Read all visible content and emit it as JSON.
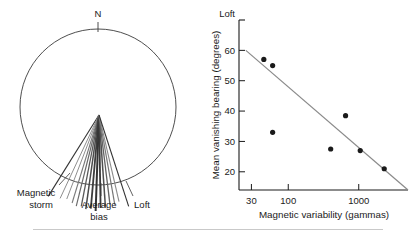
{
  "figure": {
    "panels": [
      {
        "id": "circular-diagram",
        "north_label": "N",
        "labels": {
          "magnetic_storm_line1": "Magnetic",
          "magnetic_storm_line2": "storm",
          "average_bias_line1": "Average",
          "average_bias_line2": "bias",
          "loft": "Loft"
        }
      },
      {
        "id": "scatter-plot"
      }
    ]
  },
  "chart_data": [
    {
      "type": "scatter",
      "id": "vanishing-bearing-vs-magnetic-variability",
      "title": "",
      "xlabel": "Magnetic variability (gammas)",
      "ylabel": "Mean vanishing bearing (degrees)",
      "xscale": "log",
      "yscale": "linear",
      "xlim": [
        20,
        5000
      ],
      "ylim": [
        14,
        70
      ],
      "xticks": [
        30,
        100,
        1000
      ],
      "xtick_labels": [
        "30",
        "100",
        "1000"
      ],
      "yticks": [
        20,
        30,
        40,
        50,
        60
      ],
      "ytick_labels": [
        "20",
        "30",
        "40",
        "50",
        "60"
      ],
      "y_top_label": "Loft",
      "y_top_value": 70,
      "grid": false,
      "legend": null,
      "x": [
        45,
        60,
        60,
        400,
        650,
        1050,
        2300
      ],
      "y": [
        57,
        55,
        33,
        27.5,
        38.5,
        27,
        21,
        0
      ],
      "points": [
        {
          "x": 45,
          "y": 57
        },
        {
          "x": 60,
          "y": 55
        },
        {
          "x": 60,
          "y": 33
        },
        {
          "x": 400,
          "y": 27.5
        },
        {
          "x": 650,
          "y": 38.5
        },
        {
          "x": 1050,
          "y": 27
        },
        {
          "x": 2300,
          "y": 21
        }
      ],
      "trendline": {
        "type": "line",
        "x": [
          25,
          5000
        ],
        "y": [
          60,
          14
        ],
        "color": "#8a8a8a"
      },
      "marker_color": "#1a1a1a",
      "axis_color": "#1a1a1a"
    },
    {
      "type": "polar-vector",
      "id": "vanishing-bearings-circle",
      "title": "",
      "north_label": "N",
      "note": "Circular diagram of individual vanishing bearing vectors radiating from a release point; bearings given in compass degrees clockwise from North.",
      "circle": {
        "cx": 98,
        "cy": 107,
        "r": 78
      },
      "origin": {
        "x": 99,
        "y": 115
      },
      "bearings_deg": [
        212,
        214,
        189,
        191,
        193,
        176,
        178,
        180,
        182,
        184,
        186,
        170,
        168,
        165,
        162,
        160
      ],
      "annotated_bearings": {
        "magnetic_storm": 212,
        "average_bias": 180,
        "loft": 162
      },
      "ray_colors": {
        "dark": "#333333",
        "mid": "#6e6e6e",
        "light": "#9a9a9a"
      },
      "rays": [
        {
          "bearing": 212,
          "color": "#333333",
          "width": 1.1,
          "length": 96
        },
        {
          "bearing": 205,
          "color": "#8e8e8e",
          "width": 1.0,
          "length": 92
        },
        {
          "bearing": 201,
          "color": "#8e8e8e",
          "width": 1.0,
          "length": 90
        },
        {
          "bearing": 197,
          "color": "#7a7a7a",
          "width": 1.1,
          "length": 92
        },
        {
          "bearing": 194,
          "color": "#6a6a6a",
          "width": 1.2,
          "length": 94
        },
        {
          "bearing": 191,
          "color": "#595959",
          "width": 1.3,
          "length": 93
        },
        {
          "bearing": 188,
          "color": "#4a4a4a",
          "width": 1.5,
          "length": 95
        },
        {
          "bearing": 185,
          "color": "#3d3d3d",
          "width": 1.8,
          "length": 94
        },
        {
          "bearing": 182,
          "color": "#333333",
          "width": 2.0,
          "length": 96
        },
        {
          "bearing": 179,
          "color": "#3a3a3a",
          "width": 1.8,
          "length": 93
        },
        {
          "bearing": 176,
          "color": "#4f4f4f",
          "width": 1.5,
          "length": 92
        },
        {
          "bearing": 173,
          "color": "#636363",
          "width": 1.3,
          "length": 90
        },
        {
          "bearing": 170,
          "color": "#777777",
          "width": 1.2,
          "length": 91
        },
        {
          "bearing": 167,
          "color": "#8a8a8a",
          "width": 1.1,
          "length": 89
        },
        {
          "bearing": 162,
          "color": "#333333",
          "width": 1.1,
          "length": 96
        }
      ]
    }
  ]
}
